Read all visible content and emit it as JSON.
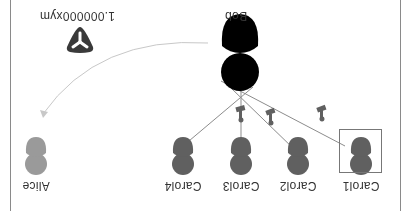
{
  "diagram": {
    "orientation": "rotated-180",
    "colors": {
      "sender": "#000000",
      "recipient": "#606060",
      "target": "#9a9a9a",
      "edge": "#8c8c8c",
      "arrow": "#c8c8c8",
      "badge": "#3a3a3a"
    },
    "sender": {
      "name": "Bob"
    },
    "recipients": [
      {
        "name": "Carol1",
        "selected": true,
        "icon": "signature-stamp-icon"
      },
      {
        "name": "Carol2",
        "selected": false,
        "icon": "signature-stamp-icon"
      },
      {
        "name": "Carol3",
        "selected": false,
        "icon": "signature-stamp-icon"
      },
      {
        "name": "Carol4",
        "selected": false,
        "icon": "none"
      }
    ],
    "target": {
      "name": "Alice"
    },
    "transfer": {
      "amount_label": "1.000000xym",
      "icon": "symbol-mosaic-icon"
    }
  }
}
